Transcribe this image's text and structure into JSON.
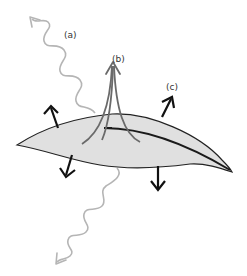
{
  "diagram": {
    "labels": {
      "a": "(a)",
      "b": "(b)",
      "c": "(c)"
    },
    "colors": {
      "leaf_fill": "#e0e0e0",
      "leaf_stroke": "#222222",
      "wave_stroke": "#b0b0b0",
      "flux_stroke": "#6a6a6a",
      "arrow_stroke": "#111111",
      "label_text": "#333333"
    }
  }
}
